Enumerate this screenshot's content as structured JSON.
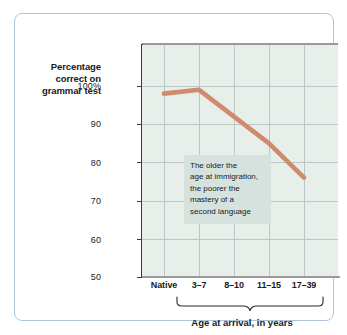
{
  "chart_data": {
    "type": "line",
    "title": "",
    "subtitle": "",
    "categories": [
      "Native",
      "3–7",
      "8–10",
      "11–15",
      "17–39"
    ],
    "values": [
      98,
      99,
      92,
      85,
      76
    ],
    "series": [
      {
        "name": "Percentage correct on grammar test",
        "values": [
          98,
          99,
          92,
          85,
          76
        ],
        "color": "#d08a6e"
      }
    ],
    "xlabel": "Age at arrival, in years",
    "ylabel": "Percentage correct on grammar test",
    "ylim": [
      50,
      100
    ],
    "yticks": [
      100,
      90,
      80,
      70,
      60,
      50
    ],
    "ytick_labels": [
      "100%",
      "90",
      "80",
      "70",
      "60",
      "50"
    ],
    "grid": true,
    "legend": "none",
    "annotations": [
      "The older the",
      "age at immigration,",
      "the poorer the",
      "mastery of a",
      "second language"
    ]
  },
  "y_axis": {
    "title_lines": [
      "Percentage",
      "correct on",
      "grammar test"
    ],
    "tick_labels": [
      "100%",
      "90",
      "80",
      "70",
      "60",
      "50"
    ]
  },
  "x_axis": {
    "tick_labels": [
      "Native",
      "3–7",
      "8–10",
      "11–15",
      "17–39"
    ],
    "caption": "Age at arrival, in years"
  },
  "annotation": {
    "lines": [
      "The older the",
      "age at immigration,",
      "the poorer the",
      "mastery of a",
      "second language"
    ]
  },
  "colors": {
    "line": "#d08a6e",
    "plot_background": "#e8efeb",
    "annotation_background": "#d6e2de",
    "grid": "#b9c8c2",
    "frame_border": "#aec4dd",
    "axis": "#3d3d3d"
  }
}
